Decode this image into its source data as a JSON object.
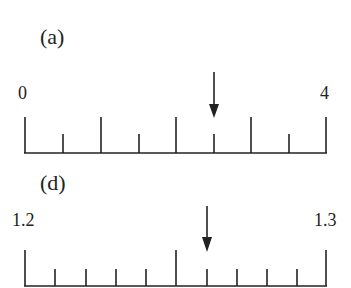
{
  "panels": [
    {
      "label": "(a)",
      "start_label": "0",
      "end_label": "4",
      "arrow_value": 2.0
    },
    {
      "label": "(d)",
      "start_label": "1.2",
      "end_label": "1.3",
      "arrow_value": 1.26
    }
  ],
  "colors": {
    "ink": "#222222",
    "background": "#ffffff"
  }
}
